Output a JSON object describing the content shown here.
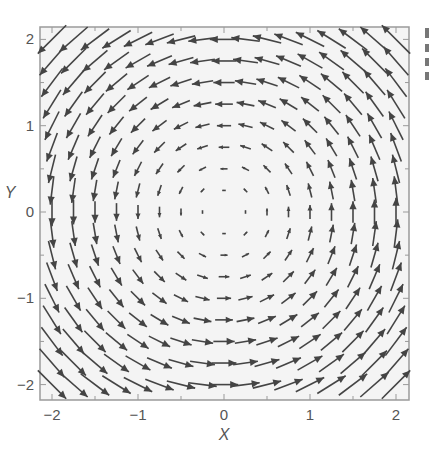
{
  "chart_data": {
    "type": "quiver",
    "title": "",
    "xlabel": "X",
    "ylabel": "Y",
    "xlim": [
      -2.2,
      2.2
    ],
    "ylim": [
      -2.2,
      2.2
    ],
    "xticks": [
      -2,
      -1,
      0,
      1,
      2
    ],
    "yticks": [
      -2,
      -1,
      0,
      1,
      2
    ],
    "xtick_labels": [
      "−2",
      "−1",
      "0",
      "1",
      "2"
    ],
    "ytick_labels": [
      "−2",
      "−1",
      "0",
      "1",
      "2"
    ],
    "minor_tick_step": 0.5,
    "grid": false,
    "field": {
      "description": "counterclockwise rotation: u = -y, v = x",
      "u": "-y",
      "v": "x",
      "x_range": [
        -2,
        2
      ],
      "y_range": [
        -2,
        2
      ],
      "step": 0.25,
      "arrow_scale": 0.165
    },
    "colors": {
      "arrow": "#444444",
      "plot_background": "#f4f4f4",
      "frame": "#9a9a9a",
      "text": "#555555"
    }
  },
  "clipped_side_text": [
    "",
    "",
    "",
    ""
  ]
}
